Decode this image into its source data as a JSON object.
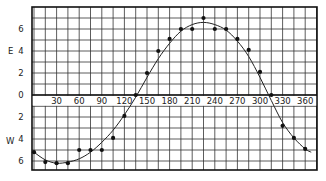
{
  "chart_data": {
    "type": "scatter",
    "title": "",
    "xlabel": "",
    "ylabel_top": "E",
    "ylabel_bottom": "W",
    "x_tick_labels": [
      "30",
      "60",
      "90",
      "120",
      "150",
      "180",
      "210",
      "240",
      "270",
      "300",
      "330",
      "360"
    ],
    "x_ticks": [
      30,
      60,
      90,
      120,
      150,
      180,
      210,
      240,
      270,
      300,
      330,
      360
    ],
    "y_tick_labels_top": [
      "6",
      "4",
      "2",
      "0"
    ],
    "y_tick_labels_bottom": [
      "2",
      "4",
      "6"
    ],
    "xlim": [
      0,
      375
    ],
    "ylim": [
      -6.8,
      7.9
    ],
    "grid": true,
    "grid_x_step": 15,
    "grid_y_step": 1,
    "series": [
      {
        "name": "observations",
        "style": "points",
        "x": [
          0,
          15,
          30,
          45,
          60,
          75,
          90,
          105,
          120,
          135,
          150,
          165,
          180,
          195,
          210,
          225,
          240,
          255,
          270,
          285,
          300,
          315,
          330,
          345,
          360
        ],
        "y": [
          -5.2,
          -6.1,
          -6.2,
          -6.2,
          -5.0,
          -5.0,
          -5.0,
          -3.9,
          -1.9,
          0.0,
          2.0,
          4.0,
          5.1,
          6.0,
          6.0,
          7.0,
          6.0,
          6.0,
          5.1,
          4.1,
          2.1,
          0.0,
          -2.8,
          -3.9,
          -4.9
        ]
      },
      {
        "name": "fitted curve",
        "style": "line",
        "x": [
          0,
          15,
          30,
          45,
          60,
          75,
          90,
          105,
          120,
          135,
          150,
          165,
          180,
          195,
          210,
          225,
          240,
          255,
          270,
          285,
          300,
          315,
          330,
          345,
          360,
          368
        ],
        "y": [
          -5.2,
          -5.9,
          -6.2,
          -6.1,
          -5.8,
          -5.2,
          -4.3,
          -3.2,
          -1.8,
          -0.2,
          1.6,
          3.3,
          4.7,
          5.8,
          6.4,
          6.6,
          6.4,
          5.9,
          4.9,
          3.5,
          1.6,
          -0.5,
          -2.5,
          -3.9,
          -4.9,
          -5.2
        ]
      }
    ]
  }
}
